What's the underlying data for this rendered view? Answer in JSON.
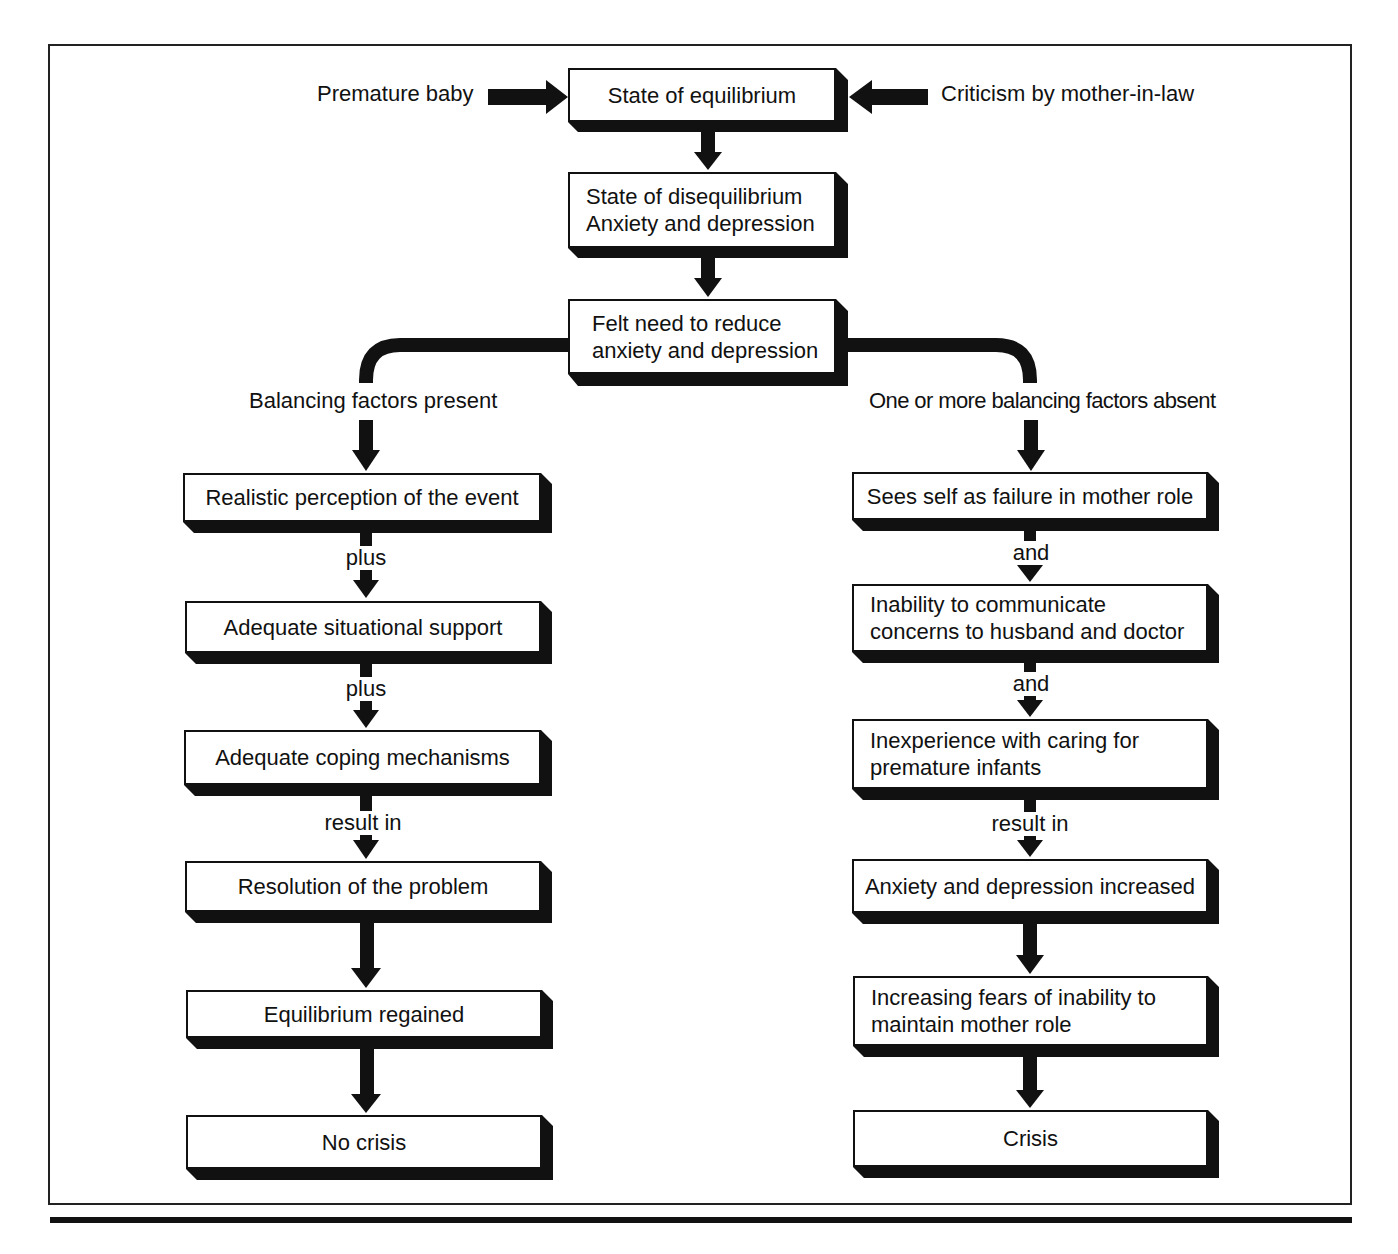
{
  "diagram": {
    "inputs": {
      "left": "Premature baby",
      "right": "Criticism by mother-in-law"
    },
    "top_chain": [
      {
        "lines": [
          "State of equilibrium"
        ]
      },
      {
        "lines": [
          "State of disequilibrium",
          "Anxiety and depression"
        ]
      },
      {
        "lines": [
          "Felt need to reduce",
          "anxiety and depression"
        ]
      }
    ],
    "branches": {
      "left": {
        "condition": "Balancing factors present",
        "steps": [
          {
            "text": "Realistic perception of the event",
            "connector_after": "plus"
          },
          {
            "text": "Adequate situational support",
            "connector_after": "plus"
          },
          {
            "text": "Adequate coping mechanisms",
            "connector_after": "result in"
          },
          {
            "text": "Resolution of the problem",
            "connector_after": ""
          },
          {
            "text": "Equilibrium regained",
            "connector_after": ""
          },
          {
            "text": "No crisis",
            "connector_after": ""
          }
        ]
      },
      "right": {
        "condition": "One or more balancing factors absent",
        "steps": [
          {
            "lines": [
              "Sees self as failure in mother role"
            ],
            "connector_after": "and"
          },
          {
            "lines": [
              "Inability to communicate",
              "concerns to husband and doctor"
            ],
            "connector_after": "and"
          },
          {
            "lines": [
              "Inexperience with caring for",
              "premature infants"
            ],
            "connector_after": "result in"
          },
          {
            "lines": [
              "Anxiety and depression increased"
            ],
            "connector_after": ""
          },
          {
            "lines": [
              "Increasing fears of inability to",
              "maintain mother role"
            ],
            "connector_after": ""
          },
          {
            "lines": [
              "Crisis"
            ],
            "connector_after": ""
          }
        ]
      }
    }
  },
  "colors": {
    "ink": "#111111",
    "background": "#ffffff"
  }
}
